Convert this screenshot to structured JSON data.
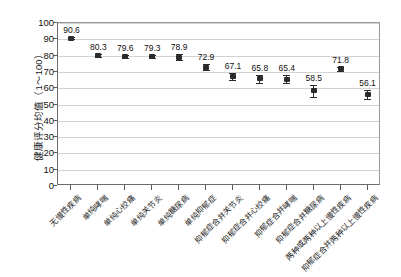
{
  "chart_data": {
    "type": "scatter",
    "title": "",
    "xlabel": "",
    "ylabel": "健康评分均值（1～100）",
    "ylim": [
      0,
      100
    ],
    "yticks": [
      "100",
      "90",
      "80",
      "70",
      "60",
      "50",
      "40",
      "30",
      "20",
      "10",
      "0"
    ],
    "grid": true,
    "legend": "none",
    "error_bars": true,
    "categories": [
      "无慢性疾病",
      "单纯哮喘",
      "单纯心绞痛",
      "单纯关节炎",
      "单纯糖尿病",
      "单纯抑郁症",
      "抑郁症合并关节炎",
      "抑郁症合并心绞痛",
      "抑郁症合并哮喘",
      "抑郁症合并糖尿病",
      "两种或两种以上慢性疾病",
      "抑郁症合并两种以上慢性疾病"
    ],
    "values": [
      90.6,
      80.3,
      79.6,
      79.3,
      78.9,
      72.9,
      67.1,
      65.8,
      65.4,
      58.5,
      71.8,
      56.1
    ],
    "value_labels": [
      "90.6",
      "80.3",
      "79.6",
      "79.3",
      "78.9",
      "72.9",
      "67.1",
      "65.8",
      "65.4",
      "58.5",
      "71.8",
      "56.1"
    ],
    "errors": [
      0.6,
      0.9,
      1.0,
      1.0,
      1.9,
      2.0,
      2.1,
      2.6,
      2.4,
      3.6,
      1.3,
      2.5
    ]
  }
}
